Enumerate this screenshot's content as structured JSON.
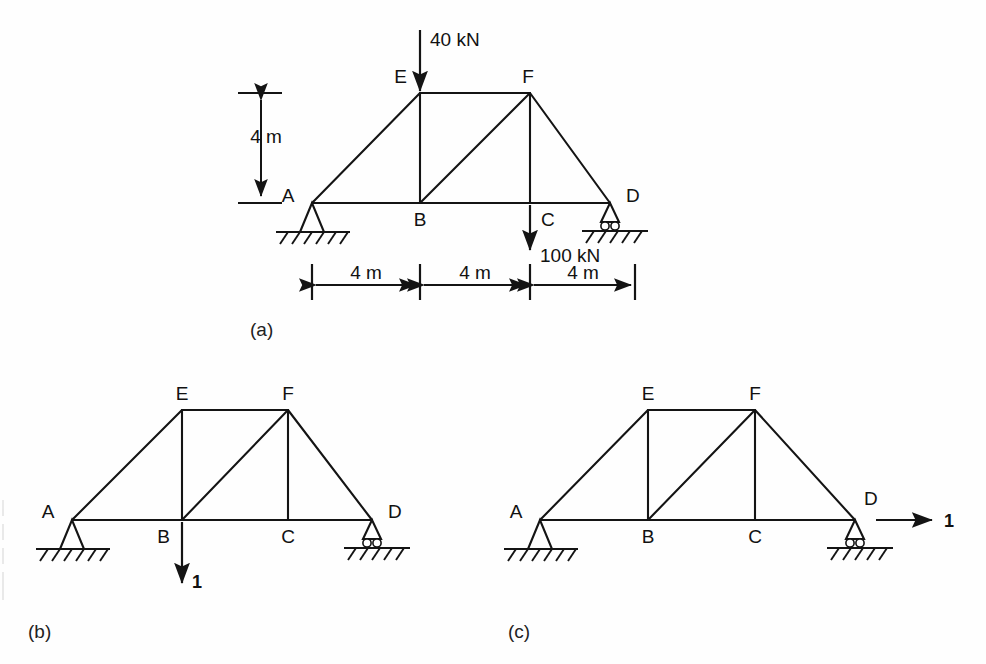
{
  "figure": {
    "panels": [
      {
        "caption": "(a)",
        "description": "Loaded truss with applied forces and span dimensions",
        "nodes": [
          "A",
          "B",
          "C",
          "D",
          "E",
          "F"
        ],
        "loads": [
          {
            "label": "40 kN",
            "at": "E",
            "direction": "down"
          },
          {
            "label": "100 kN",
            "at": "C",
            "direction": "down"
          }
        ],
        "dimensions": {
          "height_label": "4 m",
          "span_labels": [
            "4 m",
            "4 m",
            "4 m"
          ]
        },
        "supports": [
          {
            "at": "A",
            "type": "pin"
          },
          {
            "at": "D",
            "type": "roller"
          }
        ]
      },
      {
        "caption": "(b)",
        "description": "Unit virtual load applied downward at B",
        "nodes": [
          "A",
          "B",
          "C",
          "D",
          "E",
          "F"
        ],
        "loads": [
          {
            "label": "1",
            "at": "B",
            "direction": "down"
          }
        ],
        "supports": [
          {
            "at": "A",
            "type": "pin"
          },
          {
            "at": "D",
            "type": "roller"
          }
        ]
      },
      {
        "caption": "(c)",
        "description": "Unit virtual load applied horizontally at D",
        "nodes": [
          "A",
          "B",
          "C",
          "D",
          "E",
          "F"
        ],
        "loads": [
          {
            "label": "1",
            "at": "D",
            "direction": "right"
          }
        ],
        "supports": [
          {
            "at": "A",
            "type": "pin"
          },
          {
            "at": "D",
            "type": "roller"
          }
        ]
      }
    ],
    "node_labels": {
      "A": "A",
      "B": "B",
      "C": "C",
      "D": "D",
      "E": "E",
      "F": "F"
    },
    "colors": {
      "ink": "#141414",
      "background": "#ffffff"
    }
  }
}
